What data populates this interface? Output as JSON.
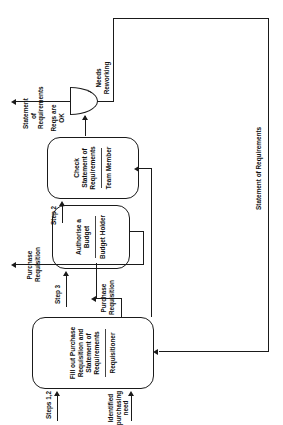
{
  "diagram": {
    "orientation": "rotated-90-ccw",
    "line_color": "#1a1a1a",
    "background": "#ffffff"
  },
  "nodes": [
    {
      "id": "fill-out",
      "task": "Fill out Purchase Requisition and Statement of Requirements",
      "role": "Requisitioner"
    },
    {
      "id": "authorise-budget",
      "task": "Authorise a Budget",
      "role": "Budget Holder"
    },
    {
      "id": "check-statement",
      "task": "Check Statement of Requirements",
      "role": "Team Member"
    }
  ],
  "gateway": {
    "id": "reqs-check-gateway",
    "label_yes": "Reqs are OK",
    "label_no": "Needs Reworking"
  },
  "flow_labels": {
    "identified_need": "Identified purchasing need",
    "steps_1_2": "Steps 1,2",
    "step_3": "Step 3",
    "step_2": "Step 2",
    "purchase_requisition_in": "Purchase Requisition",
    "purchase_requisition_out": "Purchase Requisition",
    "statement_of_requirements_out": "Statement of Requirements",
    "statement_of_requirements_loop": "Statement of Requirements"
  }
}
